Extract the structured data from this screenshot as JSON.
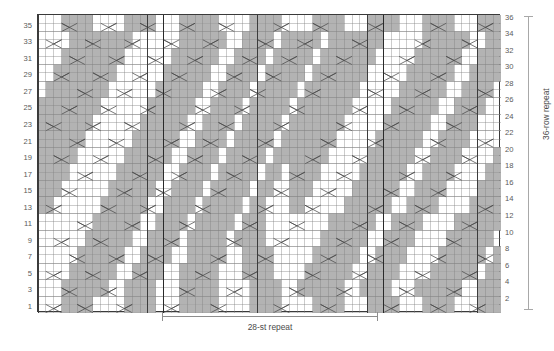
{
  "chart_data": {
    "type": "table",
    "columns": 59,
    "rows": 36,
    "st_repeat": 28,
    "row_repeat": 36,
    "cell_w": 7.85,
    "cell_h": 8.27,
    "colors": {
      "purl_fill": "#b3b3b3",
      "knit_fill": "#ffffff",
      "grid_line": "#808080",
      "heavy_line": "#3c3c3c",
      "symbol_line": "#4a4a4a",
      "border": "#3a3a3a",
      "label_text": "#5a5a5a"
    },
    "heavy_columns": [
      0,
      14,
      28,
      42,
      56,
      59
    ],
    "repeat_bounds": [
      16,
      44
    ],
    "left_row_labels": [
      35,
      33,
      31,
      29,
      27,
      25,
      23,
      21,
      19,
      17,
      15,
      13,
      11,
      9,
      7,
      5,
      3,
      1
    ],
    "right_row_labels": [
      36,
      34,
      32,
      30,
      28,
      26,
      24,
      22,
      20,
      18,
      16,
      14,
      12,
      10,
      8,
      6,
      4,
      2
    ],
    "purl_map": [
      "00011110000111100011111000011110000111100011110001111000111",
      "00011110000111100011111000011110000111100011110001111000111",
      "00011111100111100011111000011110011111100111100011111100111",
      "00011111100111100011111000011110011111100111100011111100111",
      "00001111110011110011111000111100001111110011110000111111011",
      "00001111110011110011111000111100001111110011110000111111011",
      "00000111111001111001111100111100000111111001111000011111101",
      "00000111111001111001111100111100000111111001111000011111101",
      "00000011111100111101111101111000000011111100111100001111110",
      "00000011111100111101111101111000000011111100111100001111110",
      "00000001111110011110111110111000000001111110011110000111111",
      "00000001111110011110111110111000000001111110011110000111111",
      "11000000111111001111011111011000110000011111100111100001111",
      "11000000111111001111011111011000110000011111100111100001111",
      "11100000011111100111101111101100111000001111110011110000111",
      "11100000011111100111101111101100111000001111110011110000111",
      "11110000001111110011110111110110111100000111111001111000011",
      "11110000001111110011110111110110111100000111111001111000011",
      "11111000000111111001111011111011111110000011111100111100001",
      "11111000000111111001111011111011111110000011111100111100001",
      "11111100000011111100111101111101111111000001111110011110000",
      "11111100000011111100111101111101111111000001111110011110000",
      "11111110000001111110011110111110111111100000111111001111000",
      "11111110000001111110011110111110111111100000111111001111000",
      "11111111000000111111001111011111011111110000011111100111100",
      "11111111000000111111001111011111011111110000011111100111100",
      "01111111100000011111100111101111101111111000001111110011110",
      "01111111100000011111100111101111101111111000001111110011110",
      "00111111110000001111110011110111110111111100000111111001111",
      "00111111110000001111110011110111110111111100000111111001111",
      "00011111111000000111111001111011111011111110000011111100111",
      "00011111111000000111111001111011111011111110000011111100111",
      "00001111111100000011111100111101111101111111000001111110011",
      "00001111111100000011111100111101111101111111000001111110011",
      "00011110000111100011111000011110000111100011110001111000111",
      "00011110000111100011111000011110000111100011110001111000111"
    ],
    "symbol_rows": [
      {
        "row": 1,
        "cells": [
          [
            1,
            "rc"
          ],
          [
            5,
            "lc"
          ],
          [
            10,
            "rc"
          ],
          [
            16,
            "rc"
          ],
          [
            22,
            "lc"
          ],
          [
            30,
            "rc"
          ],
          [
            36,
            "lc"
          ],
          [
            44,
            "rc"
          ],
          [
            50,
            "lc"
          ],
          [
            55,
            "rc"
          ]
        ]
      },
      {
        "row": 3,
        "cells": [
          [
            3,
            "lc"
          ],
          [
            8,
            "rc"
          ],
          [
            18,
            "lc"
          ],
          [
            24,
            "rc"
          ],
          [
            32,
            "lc"
          ],
          [
            38,
            "rc"
          ],
          [
            46,
            "lc"
          ],
          [
            52,
            "rc"
          ]
        ]
      },
      {
        "row": 5,
        "cells": [
          [
            1,
            "rc"
          ],
          [
            6,
            "lc"
          ],
          [
            12,
            "rc"
          ],
          [
            20,
            "lc"
          ],
          [
            26,
            "rc"
          ],
          [
            34,
            "lc"
          ],
          [
            40,
            "rc"
          ],
          [
            48,
            "lc"
          ],
          [
            54,
            "rc"
          ]
        ]
      },
      {
        "row": 7,
        "cells": [
          [
            4,
            "lc"
          ],
          [
            9,
            "rc"
          ],
          [
            14,
            "lc"
          ],
          [
            22,
            "rc"
          ],
          [
            28,
            "lc"
          ],
          [
            36,
            "rc"
          ],
          [
            42,
            "lc"
          ],
          [
            50,
            "rc"
          ],
          [
            56,
            "lc"
          ]
        ]
      },
      {
        "row": 9,
        "cells": [
          [
            2,
            "rc"
          ],
          [
            7,
            "lc"
          ],
          [
            16,
            "rc"
          ],
          [
            24,
            "lc"
          ],
          [
            30,
            "rc"
          ],
          [
            38,
            "lc"
          ],
          [
            44,
            "rc"
          ],
          [
            52,
            "lc"
          ]
        ]
      },
      {
        "row": 11,
        "cells": [
          [
            5,
            "lc"
          ],
          [
            11,
            "rc"
          ],
          [
            18,
            "lc"
          ],
          [
            26,
            "rc"
          ],
          [
            32,
            "lc"
          ],
          [
            40,
            "rc"
          ],
          [
            46,
            "lc"
          ],
          [
            54,
            "rc"
          ]
        ]
      },
      {
        "row": 13,
        "cells": [
          [
            1,
            "rc"
          ],
          [
            8,
            "lc"
          ],
          [
            13,
            "rc"
          ],
          [
            20,
            "lc"
          ],
          [
            28,
            "rc"
          ],
          [
            34,
            "lc"
          ],
          [
            42,
            "rc"
          ],
          [
            48,
            "lc"
          ],
          [
            56,
            "rc"
          ]
        ]
      },
      {
        "row": 15,
        "cells": [
          [
            3,
            "lc"
          ],
          [
            10,
            "rc"
          ],
          [
            15,
            "lc"
          ],
          [
            22,
            "rc"
          ],
          [
            30,
            "lc"
          ],
          [
            36,
            "rc"
          ],
          [
            44,
            "lc"
          ],
          [
            50,
            "rc"
          ]
        ]
      },
      {
        "row": 17,
        "cells": [
          [
            5,
            "rc"
          ],
          [
            12,
            "lc"
          ],
          [
            17,
            "rc"
          ],
          [
            24,
            "lc"
          ],
          [
            32,
            "rc"
          ],
          [
            38,
            "lc"
          ],
          [
            46,
            "rc"
          ],
          [
            52,
            "lc"
          ]
        ]
      },
      {
        "row": 19,
        "cells": [
          [
            2,
            "lc"
          ],
          [
            7,
            "rc"
          ],
          [
            14,
            "lc"
          ],
          [
            19,
            "rc"
          ],
          [
            26,
            "lc"
          ],
          [
            34,
            "rc"
          ],
          [
            40,
            "lc"
          ],
          [
            48,
            "rc"
          ],
          [
            54,
            "lc"
          ]
        ]
      },
      {
        "row": 21,
        "cells": [
          [
            4,
            "rc"
          ],
          [
            9,
            "lc"
          ],
          [
            16,
            "rc"
          ],
          [
            21,
            "lc"
          ],
          [
            28,
            "rc"
          ],
          [
            36,
            "lc"
          ],
          [
            42,
            "rc"
          ],
          [
            50,
            "lc"
          ],
          [
            56,
            "rc"
          ]
        ]
      },
      {
        "row": 23,
        "cells": [
          [
            1,
            "lc"
          ],
          [
            6,
            "rc"
          ],
          [
            11,
            "lc"
          ],
          [
            18,
            "rc"
          ],
          [
            23,
            "lc"
          ],
          [
            30,
            "rc"
          ],
          [
            38,
            "lc"
          ],
          [
            44,
            "rc"
          ],
          [
            52,
            "lc"
          ]
        ]
      },
      {
        "row": 25,
        "cells": [
          [
            3,
            "rc"
          ],
          [
            8,
            "lc"
          ],
          [
            13,
            "rc"
          ],
          [
            20,
            "lc"
          ],
          [
            25,
            "rc"
          ],
          [
            32,
            "lc"
          ],
          [
            40,
            "rc"
          ],
          [
            46,
            "lc"
          ],
          [
            54,
            "rc"
          ]
        ]
      },
      {
        "row": 27,
        "cells": [
          [
            5,
            "lc"
          ],
          [
            10,
            "rc"
          ],
          [
            15,
            "lc"
          ],
          [
            22,
            "rc"
          ],
          [
            27,
            "lc"
          ],
          [
            34,
            "rc"
          ],
          [
            42,
            "lc"
          ],
          [
            48,
            "rc"
          ],
          [
            56,
            "lc"
          ]
        ]
      },
      {
        "row": 29,
        "cells": [
          [
            2,
            "rc"
          ],
          [
            7,
            "lc"
          ],
          [
            12,
            "rc"
          ],
          [
            17,
            "lc"
          ],
          [
            24,
            "rc"
          ],
          [
            29,
            "lc"
          ],
          [
            36,
            "rc"
          ],
          [
            44,
            "lc"
          ],
          [
            50,
            "rc"
          ]
        ]
      },
      {
        "row": 31,
        "cells": [
          [
            4,
            "lc"
          ],
          [
            9,
            "rc"
          ],
          [
            14,
            "lc"
          ],
          [
            19,
            "rc"
          ],
          [
            26,
            "lc"
          ],
          [
            31,
            "rc"
          ],
          [
            38,
            "lc"
          ],
          [
            46,
            "rc"
          ],
          [
            52,
            "lc"
          ]
        ]
      },
      {
        "row": 33,
        "cells": [
          [
            1,
            "rc"
          ],
          [
            6,
            "lc"
          ],
          [
            11,
            "rc"
          ],
          [
            16,
            "lc"
          ],
          [
            21,
            "rc"
          ],
          [
            28,
            "lc"
          ],
          [
            33,
            "rc"
          ],
          [
            40,
            "lc"
          ],
          [
            48,
            "rc"
          ],
          [
            54,
            "lc"
          ]
        ]
      },
      {
        "row": 35,
        "cells": [
          [
            3,
            "lc"
          ],
          [
            8,
            "rc"
          ],
          [
            13,
            "lc"
          ],
          [
            18,
            "rc"
          ],
          [
            23,
            "lc"
          ],
          [
            30,
            "rc"
          ],
          [
            35,
            "lc"
          ],
          [
            42,
            "rc"
          ],
          [
            50,
            "lc"
          ],
          [
            56,
            "rc"
          ]
        ]
      }
    ]
  },
  "labels": {
    "st_repeat": "28-st repeat",
    "row_repeat": "36-row repeat"
  }
}
